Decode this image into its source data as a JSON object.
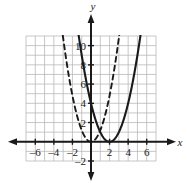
{
  "figure": {
    "kind": "coordinate-graph",
    "axis_labels": {
      "x": "x",
      "y": "y"
    },
    "colors": {
      "grid": "#b9b9b9",
      "axis": "#1a1a1a",
      "curve_solid": "#1a1a1a",
      "curve_dashed": "#1a1a1a",
      "background": "#ffffff"
    }
  },
  "chart_data": {
    "type": "line",
    "title": "",
    "xlabel": "x",
    "ylabel": "y",
    "xlim": [
      -7,
      7
    ],
    "ylim": [
      -2,
      11
    ],
    "grid": true,
    "grid_step": 1,
    "legend": "none",
    "xticks": [
      -6,
      -4,
      -2,
      2,
      4,
      6
    ],
    "xtick_labels": [
      "–6",
      "–4",
      "–2",
      "2",
      "4",
      "6"
    ],
    "yticks": [
      -2,
      2,
      4,
      6,
      8,
      10
    ],
    "ytick_labels": [
      "–2",
      "2",
      "4",
      "6",
      "8",
      "10"
    ],
    "series": [
      {
        "name": "solid-parabola",
        "style": "solid",
        "vertex": [
          2,
          0
        ],
        "leading_coefficient": 1,
        "equation": "y = (x - 2)^2",
        "x": [
          -1.2,
          -1.0,
          -0.5,
          0,
          0.5,
          1,
          1.5,
          2,
          2.5,
          3,
          3.5,
          4,
          4.5,
          5,
          5.3
        ],
        "values": [
          10.24,
          9,
          6.25,
          4,
          2.25,
          1,
          0.25,
          0,
          0.25,
          1,
          2.25,
          4,
          6.25,
          9,
          10.89
        ]
      },
      {
        "name": "dashed-parabola",
        "style": "dashed",
        "vertex": [
          0,
          0
        ],
        "leading_coefficient": 1.2,
        "equation": "y = 1.2x^2",
        "x": [
          -3.0,
          -2.5,
          -2.0,
          -1.5,
          -1.0,
          -0.5,
          0,
          0.5,
          1.0,
          1.5,
          2.0,
          2.5,
          3.0
        ],
        "values": [
          10.8,
          7.5,
          4.8,
          2.7,
          1.2,
          0.3,
          0,
          0.3,
          1.2,
          2.7,
          4.8,
          7.5,
          10.8
        ]
      }
    ]
  }
}
